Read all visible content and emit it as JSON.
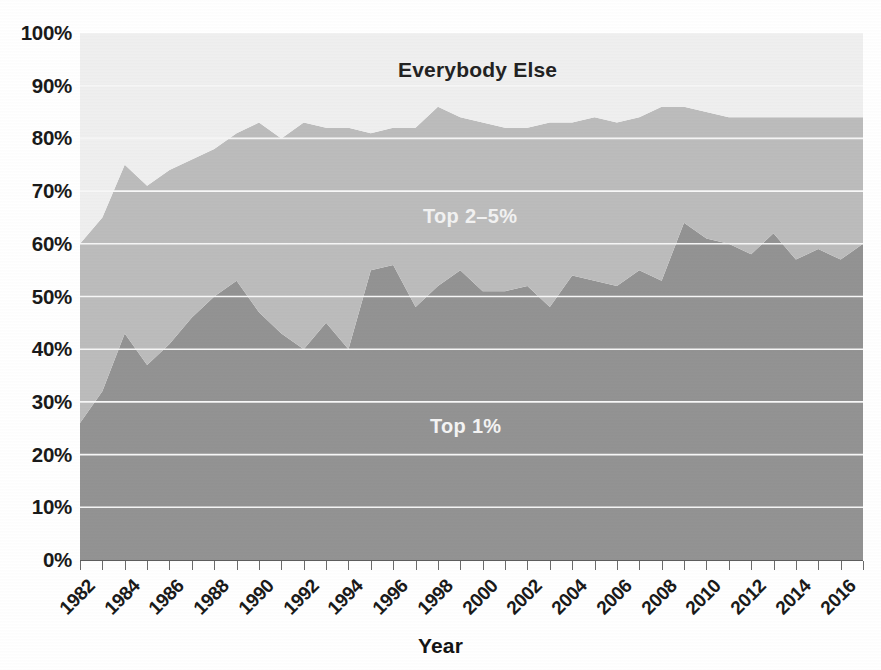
{
  "chart_data": {
    "type": "area",
    "stacked": true,
    "title": "",
    "subtitle": "",
    "xlabel": "Year",
    "ylabel": "",
    "xlim": [
      1982,
      2017
    ],
    "ylim": [
      0,
      100
    ],
    "grid": true,
    "legend_position": "in-plot-annotations",
    "y_tick_labels": [
      "100%",
      "90%",
      "80%",
      "70%",
      "60%",
      "50%",
      "40%",
      "30%",
      "20%",
      "10%",
      "0%"
    ],
    "y_tick_values": [
      100,
      90,
      80,
      70,
      60,
      50,
      40,
      30,
      20,
      10,
      0
    ],
    "x_tick_labels": [
      "1982",
      "1984",
      "1986",
      "1988",
      "1990",
      "1992",
      "1994",
      "1996",
      "1998",
      "2000",
      "2002",
      "2004",
      "2006",
      "2008",
      "2010",
      "2012",
      "2014",
      "2016"
    ],
    "x_tick_values": [
      1982,
      1984,
      1986,
      1988,
      1990,
      1992,
      1994,
      1996,
      1998,
      2000,
      2002,
      2004,
      2006,
      2008,
      2010,
      2012,
      2014,
      2016
    ],
    "x": [
      1982,
      1983,
      1984,
      1985,
      1986,
      1987,
      1988,
      1989,
      1990,
      1991,
      1992,
      1993,
      1994,
      1995,
      1996,
      1997,
      1998,
      1999,
      2000,
      2001,
      2002,
      2003,
      2004,
      2005,
      2006,
      2007,
      2008,
      2009,
      2010,
      2011,
      2012,
      2013,
      2014,
      2015,
      2016,
      2017
    ],
    "series": [
      {
        "name": "Top 1%",
        "color": "#939393",
        "values": [
          26,
          32,
          43,
          37,
          41,
          46,
          50,
          53,
          47,
          43,
          40,
          45,
          40,
          55,
          56,
          48,
          52,
          55,
          51,
          51,
          52,
          48,
          54,
          53,
          52,
          55,
          53,
          64,
          61,
          60,
          58,
          62,
          57,
          59,
          57,
          60
        ]
      },
      {
        "name": "Top 2–5%",
        "color": "#bcbcbc",
        "values": [
          34,
          33,
          32,
          34,
          33,
          30,
          28,
          28,
          36,
          37,
          43,
          37,
          42,
          26,
          26,
          34,
          34,
          29,
          32,
          31,
          30,
          35,
          29,
          31,
          31,
          29,
          33,
          22,
          24,
          24,
          26,
          22,
          27,
          25,
          27,
          24
        ]
      },
      {
        "name": "Everybody Else",
        "color": "#efefef",
        "values": [
          40,
          35,
          25,
          29,
          26,
          24,
          22,
          19,
          17,
          20,
          17,
          18,
          18,
          19,
          18,
          18,
          14,
          16,
          17,
          18,
          18,
          17,
          17,
          16,
          17,
          16,
          14,
          14,
          15,
          16,
          16,
          16,
          16,
          16,
          16,
          16
        ]
      }
    ],
    "cumulative_top5": [
      60,
      65,
      75,
      71,
      74,
      76,
      78,
      81,
      83,
      80,
      83,
      82,
      82,
      81,
      82,
      82,
      86,
      84,
      83,
      82,
      82,
      83,
      83,
      84,
      83,
      84,
      86,
      86,
      85,
      84,
      84,
      84,
      84,
      84,
      84,
      84
    ],
    "annotations": [
      {
        "text": "Everybody Else",
        "x": 1999,
        "y": 92,
        "color": "#222222"
      },
      {
        "text": "Top 2–5%",
        "x": 2000,
        "y": 65,
        "color": "#f2f2f2"
      },
      {
        "text": "Top 1%",
        "x": 2000,
        "y": 25,
        "color": "#f4f4f4"
      }
    ],
    "colors": {
      "top1": "#939393",
      "top2to5": "#bcbcbc",
      "everybody_else": "#efefef",
      "gridline": "#f7f7f7",
      "axis": "#5d5d5d",
      "text": "#1a1a1a",
      "background": "#ffffff"
    }
  },
  "axis": {
    "x_title": "Year"
  }
}
